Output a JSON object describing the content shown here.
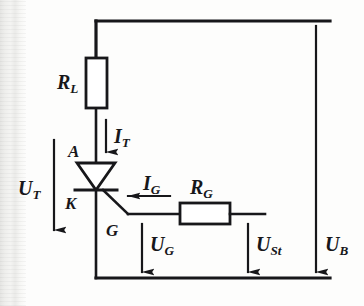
{
  "figure": {
    "type": "circuit-schematic",
    "background_color": "#fdfdfc",
    "line_color": "#17171a"
  },
  "components": {
    "load_resistor": {
      "symbol": "R",
      "subscript": "L",
      "orientation": "vertical",
      "name": "load-resistor"
    },
    "gate_resistor": {
      "symbol": "R",
      "subscript": "G",
      "orientation": "horizontal",
      "name": "gate-resistor"
    },
    "thyristor": {
      "name": "thyristor",
      "terminals": [
        {
          "letter": "A",
          "meaning": "anode"
        },
        {
          "letter": "K",
          "meaning": "cathode"
        },
        {
          "letter": "G",
          "meaning": "gate"
        }
      ]
    }
  },
  "currents": [
    {
      "symbol": "I",
      "subscript": "T",
      "direction": "down",
      "name": "thyristor-current"
    },
    {
      "symbol": "I",
      "subscript": "G",
      "direction": "left",
      "name": "gate-current"
    }
  ],
  "voltages": [
    {
      "symbol": "U",
      "subscript": "T",
      "direction": "down",
      "name": "thyristor-voltage"
    },
    {
      "symbol": "U",
      "subscript": "G",
      "direction": "down",
      "name": "gate-voltage"
    },
    {
      "symbol": "U",
      "subscript": "St",
      "direction": "down",
      "name": "control-voltage"
    },
    {
      "symbol": "U",
      "subscript": "B",
      "direction": "down",
      "name": "supply-voltage"
    }
  ],
  "labels": {
    "r_l": {
      "symbol": "R",
      "sub": "L"
    },
    "r_g": {
      "symbol": "R",
      "sub": "G"
    },
    "i_t": {
      "symbol": "I",
      "sub": "T"
    },
    "i_g": {
      "symbol": "I",
      "sub": "G"
    },
    "u_t": {
      "symbol": "U",
      "sub": "T"
    },
    "u_g": {
      "symbol": "U",
      "sub": "G"
    },
    "u_st": {
      "symbol": "U",
      "sub": "St"
    },
    "u_b": {
      "symbol": "U",
      "sub": "B"
    },
    "node_a": "A",
    "node_k": "K",
    "node_g": "G"
  }
}
